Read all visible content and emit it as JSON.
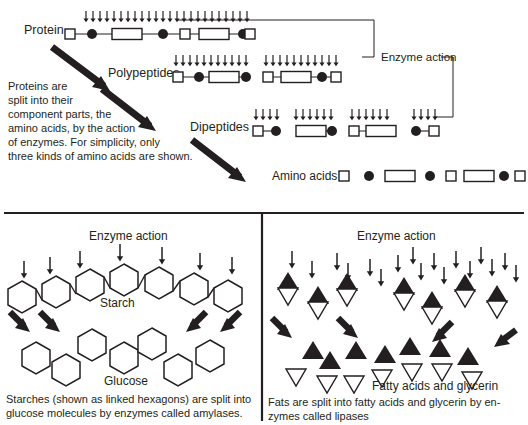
{
  "figure": {
    "title_absent": true,
    "background": "#ffffff",
    "ink": "#231f20"
  },
  "protein_panel": {
    "labels": {
      "protein": "Protein",
      "polypeptides": "Polypeptides",
      "dipeptides": "Dipeptides",
      "amino_acids": "Amino acids",
      "enzyme_action": "Enzyme action"
    },
    "caption_lines": [
      "Proteins are",
      "split into their",
      "component parts, the",
      "amino acids, by the action",
      "of enzymes. For simplicity, only",
      "three kinds of amino acids are shown."
    ],
    "protein_chain": [
      "small-square",
      "circle",
      "long-rect",
      "circle",
      "small-square",
      "long-rect",
      "circle",
      "small-square"
    ],
    "protein_arrow_count": 24,
    "polypeptides": [
      {
        "units": [
          "small-square",
          "circle",
          "long-rect",
          "circle"
        ],
        "arrows": 11
      },
      {
        "units": [
          "small-square",
          "long-rect",
          "circle",
          "small-square"
        ],
        "arrows": 11
      }
    ],
    "dipeptides": [
      {
        "units": [
          "small-square",
          "circle"
        ],
        "arrows": 4
      },
      {
        "units": [
          "long-rect",
          "circle"
        ],
        "arrows": 6
      },
      {
        "units": [
          "small-square",
          "long-rect"
        ],
        "arrows": 6
      },
      {
        "units": [
          "circle",
          "small-square"
        ],
        "arrows": 4
      }
    ],
    "amino_acid_units": [
      "small-square",
      "circle",
      "long-rect",
      "circle",
      "small-square",
      "long-rect",
      "circle",
      "small-square"
    ]
  },
  "starch_panel": {
    "labels": {
      "enzyme_action": "Enzyme action",
      "starch": "Starch",
      "glucose": "Glucose"
    },
    "caption_lines": [
      "Starches (shown as linked hexagons) are split into",
      "glucose molecules by enzymes called amylases."
    ],
    "starch_hexagon_count": 7,
    "glucose_hexagon_count": 7,
    "thin_arrow_count": 7,
    "bold_arrow_count": 4
  },
  "fat_panel": {
    "labels": {
      "enzyme_action": "Enzyme action",
      "fatty_acids": "Fatty acids and glycerin"
    },
    "caption_lines": [
      "Fats are split into fatty acids and glycerin by en-",
      "zymes called lipases"
    ],
    "fat_molecule_count": 7,
    "free_black_triangle_count": 7,
    "free_white_triangle_count": 7,
    "thin_arrow_count": 17,
    "bold_arrow_count": 4
  }
}
